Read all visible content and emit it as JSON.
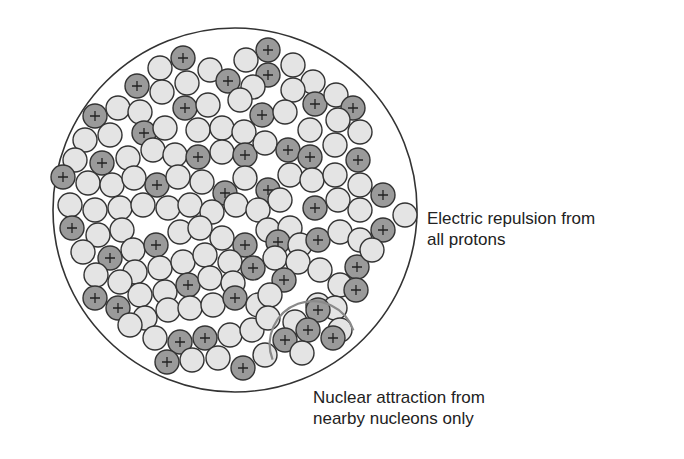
{
  "labels": {
    "repulsion": {
      "line1": "Electric repulsion from",
      "line2": "all protons"
    },
    "attraction": {
      "line1": "Nuclear attraction from",
      "line2": "nearby nucleons only"
    }
  },
  "colors": {
    "proton_fill": "#9a9a9a",
    "neutron_fill": "#e4e4e4",
    "outline": "#333333",
    "range_arc": "#8a8a8a",
    "text": "#222222"
  },
  "nucleus": {
    "cx": 235,
    "cy": 210,
    "r": 182
  },
  "nucleon_radius": 12,
  "proton_symbol": "+",
  "range_arc": {
    "cx": 313,
    "cy": 345,
    "r": 43
  },
  "nucleons": [
    {
      "x": 183,
      "y": 58,
      "p": true
    },
    {
      "x": 210,
      "y": 70,
      "p": false
    },
    {
      "x": 268,
      "y": 50,
      "p": true
    },
    {
      "x": 293,
      "y": 65,
      "p": false
    },
    {
      "x": 246,
      "y": 60,
      "p": false
    },
    {
      "x": 160,
      "y": 68,
      "p": false
    },
    {
      "x": 137,
      "y": 86,
      "p": true
    },
    {
      "x": 162,
      "y": 92,
      "p": false
    },
    {
      "x": 187,
      "y": 83,
      "p": false
    },
    {
      "x": 228,
      "y": 81,
      "p": true
    },
    {
      "x": 268,
      "y": 75,
      "p": true
    },
    {
      "x": 253,
      "y": 87,
      "p": false
    },
    {
      "x": 313,
      "y": 82,
      "p": false
    },
    {
      "x": 293,
      "y": 90,
      "p": false
    },
    {
      "x": 315,
      "y": 104,
      "p": true
    },
    {
      "x": 336,
      "y": 95,
      "p": false
    },
    {
      "x": 353,
      "y": 108,
      "p": true
    },
    {
      "x": 95,
      "y": 116,
      "p": true
    },
    {
      "x": 118,
      "y": 108,
      "p": false
    },
    {
      "x": 140,
      "y": 112,
      "p": false
    },
    {
      "x": 185,
      "y": 108,
      "p": true
    },
    {
      "x": 208,
      "y": 105,
      "p": false
    },
    {
      "x": 240,
      "y": 100,
      "p": false
    },
    {
      "x": 262,
      "y": 115,
      "p": true
    },
    {
      "x": 285,
      "y": 112,
      "p": false
    },
    {
      "x": 338,
      "y": 120,
      "p": false
    },
    {
      "x": 360,
      "y": 132,
      "p": false
    },
    {
      "x": 85,
      "y": 140,
      "p": false
    },
    {
      "x": 110,
      "y": 135,
      "p": false
    },
    {
      "x": 144,
      "y": 133,
      "p": true
    },
    {
      "x": 165,
      "y": 128,
      "p": false
    },
    {
      "x": 198,
      "y": 130,
      "p": false
    },
    {
      "x": 222,
      "y": 128,
      "p": false
    },
    {
      "x": 244,
      "y": 132,
      "p": false
    },
    {
      "x": 310,
      "y": 130,
      "p": false
    },
    {
      "x": 75,
      "y": 160,
      "p": false
    },
    {
      "x": 102,
      "y": 163,
      "p": true
    },
    {
      "x": 128,
      "y": 158,
      "p": false
    },
    {
      "x": 153,
      "y": 150,
      "p": false
    },
    {
      "x": 175,
      "y": 155,
      "p": false
    },
    {
      "x": 198,
      "y": 157,
      "p": true
    },
    {
      "x": 222,
      "y": 152,
      "p": false
    },
    {
      "x": 245,
      "y": 155,
      "p": true
    },
    {
      "x": 265,
      "y": 143,
      "p": false
    },
    {
      "x": 288,
      "y": 150,
      "p": true
    },
    {
      "x": 310,
      "y": 157,
      "p": true
    },
    {
      "x": 335,
      "y": 145,
      "p": false
    },
    {
      "x": 358,
      "y": 160,
      "p": true
    },
    {
      "x": 63,
      "y": 177,
      "p": true
    },
    {
      "x": 88,
      "y": 183,
      "p": false
    },
    {
      "x": 112,
      "y": 185,
      "p": false
    },
    {
      "x": 134,
      "y": 178,
      "p": false
    },
    {
      "x": 157,
      "y": 185,
      "p": true
    },
    {
      "x": 178,
      "y": 177,
      "p": false
    },
    {
      "x": 202,
      "y": 182,
      "p": false
    },
    {
      "x": 225,
      "y": 193,
      "p": true
    },
    {
      "x": 245,
      "y": 178,
      "p": false
    },
    {
      "x": 268,
      "y": 190,
      "p": true
    },
    {
      "x": 290,
      "y": 175,
      "p": false
    },
    {
      "x": 312,
      "y": 180,
      "p": false
    },
    {
      "x": 335,
      "y": 175,
      "p": false
    },
    {
      "x": 360,
      "y": 185,
      "p": false
    },
    {
      "x": 383,
      "y": 195,
      "p": true
    },
    {
      "x": 70,
      "y": 205,
      "p": false
    },
    {
      "x": 95,
      "y": 210,
      "p": false
    },
    {
      "x": 120,
      "y": 208,
      "p": false
    },
    {
      "x": 143,
      "y": 205,
      "p": false
    },
    {
      "x": 168,
      "y": 208,
      "p": false
    },
    {
      "x": 190,
      "y": 205,
      "p": false
    },
    {
      "x": 212,
      "y": 212,
      "p": false
    },
    {
      "x": 236,
      "y": 205,
      "p": false
    },
    {
      "x": 258,
      "y": 210,
      "p": false
    },
    {
      "x": 280,
      "y": 200,
      "p": false
    },
    {
      "x": 315,
      "y": 208,
      "p": true
    },
    {
      "x": 338,
      "y": 200,
      "p": false
    },
    {
      "x": 360,
      "y": 210,
      "p": false
    },
    {
      "x": 405,
      "y": 215,
      "p": false
    },
    {
      "x": 72,
      "y": 228,
      "p": true
    },
    {
      "x": 98,
      "y": 235,
      "p": false
    },
    {
      "x": 122,
      "y": 230,
      "p": false
    },
    {
      "x": 133,
      "y": 250,
      "p": false
    },
    {
      "x": 156,
      "y": 245,
      "p": true
    },
    {
      "x": 180,
      "y": 232,
      "p": false
    },
    {
      "x": 200,
      "y": 228,
      "p": false
    },
    {
      "x": 222,
      "y": 238,
      "p": false
    },
    {
      "x": 245,
      "y": 245,
      "p": true
    },
    {
      "x": 268,
      "y": 230,
      "p": false
    },
    {
      "x": 290,
      "y": 228,
      "p": false
    },
    {
      "x": 278,
      "y": 242,
      "p": true
    },
    {
      "x": 300,
      "y": 245,
      "p": false
    },
    {
      "x": 318,
      "y": 240,
      "p": true
    },
    {
      "x": 340,
      "y": 232,
      "p": false
    },
    {
      "x": 360,
      "y": 240,
      "p": false
    },
    {
      "x": 383,
      "y": 230,
      "p": true
    },
    {
      "x": 83,
      "y": 252,
      "p": false
    },
    {
      "x": 110,
      "y": 258,
      "p": true
    },
    {
      "x": 135,
      "y": 272,
      "p": false
    },
    {
      "x": 160,
      "y": 268,
      "p": false
    },
    {
      "x": 183,
      "y": 262,
      "p": false
    },
    {
      "x": 205,
      "y": 255,
      "p": false
    },
    {
      "x": 230,
      "y": 262,
      "p": false
    },
    {
      "x": 253,
      "y": 268,
      "p": true
    },
    {
      "x": 275,
      "y": 258,
      "p": false
    },
    {
      "x": 298,
      "y": 262,
      "p": false
    },
    {
      "x": 320,
      "y": 270,
      "p": false
    },
    {
      "x": 357,
      "y": 267,
      "p": true
    },
    {
      "x": 372,
      "y": 250,
      "p": false
    },
    {
      "x": 96,
      "y": 275,
      "p": false
    },
    {
      "x": 120,
      "y": 282,
      "p": false
    },
    {
      "x": 140,
      "y": 295,
      "p": false
    },
    {
      "x": 165,
      "y": 292,
      "p": false
    },
    {
      "x": 188,
      "y": 285,
      "p": true
    },
    {
      "x": 210,
      "y": 278,
      "p": false
    },
    {
      "x": 233,
      "y": 283,
      "p": false
    },
    {
      "x": 284,
      "y": 280,
      "p": true
    },
    {
      "x": 340,
      "y": 285,
      "p": false
    },
    {
      "x": 356,
      "y": 290,
      "p": true
    },
    {
      "x": 95,
      "y": 298,
      "p": true
    },
    {
      "x": 118,
      "y": 308,
      "p": true
    },
    {
      "x": 145,
      "y": 318,
      "p": false
    },
    {
      "x": 168,
      "y": 310,
      "p": false
    },
    {
      "x": 190,
      "y": 308,
      "p": false
    },
    {
      "x": 213,
      "y": 305,
      "p": false
    },
    {
      "x": 235,
      "y": 298,
      "p": true
    },
    {
      "x": 258,
      "y": 305,
      "p": false
    },
    {
      "x": 270,
      "y": 295,
      "p": false
    },
    {
      "x": 318,
      "y": 305,
      "p": false
    },
    {
      "x": 335,
      "y": 308,
      "p": false
    },
    {
      "x": 130,
      "y": 325,
      "p": false
    },
    {
      "x": 155,
      "y": 338,
      "p": false
    },
    {
      "x": 180,
      "y": 342,
      "p": true
    },
    {
      "x": 205,
      "y": 338,
      "p": true
    },
    {
      "x": 230,
      "y": 335,
      "p": false
    },
    {
      "x": 252,
      "y": 330,
      "p": false
    },
    {
      "x": 268,
      "y": 318,
      "p": false
    },
    {
      "x": 295,
      "y": 322,
      "p": false
    },
    {
      "x": 318,
      "y": 310,
      "p": true
    },
    {
      "x": 340,
      "y": 330,
      "p": false
    },
    {
      "x": 167,
      "y": 362,
      "p": true
    },
    {
      "x": 192,
      "y": 360,
      "p": false
    },
    {
      "x": 218,
      "y": 358,
      "p": false
    },
    {
      "x": 243,
      "y": 368,
      "p": true
    },
    {
      "x": 265,
      "y": 355,
      "p": false
    },
    {
      "x": 285,
      "y": 340,
      "p": true
    },
    {
      "x": 308,
      "y": 330,
      "p": true
    },
    {
      "x": 333,
      "y": 338,
      "p": true
    },
    {
      "x": 302,
      "y": 353,
      "p": false
    }
  ]
}
